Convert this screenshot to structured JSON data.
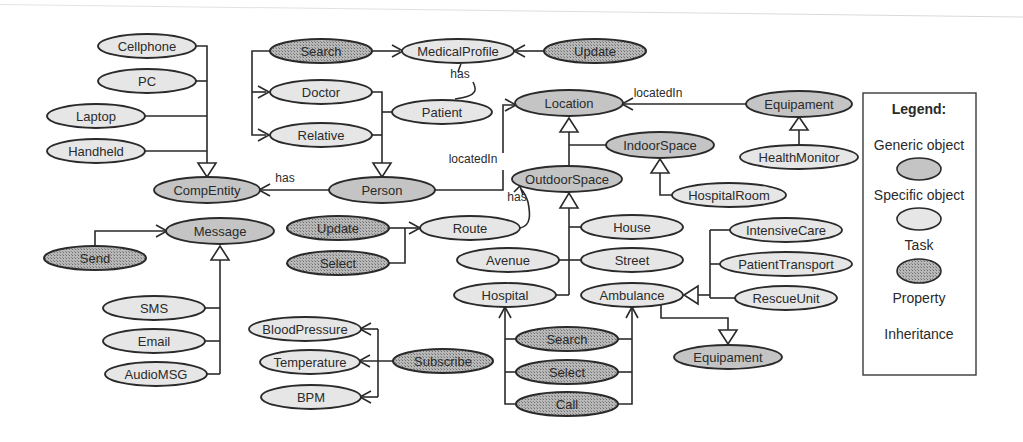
{
  "diagram": {
    "colors": {
      "generic_fill": "#c4c4c4",
      "specific_fill": "#e6e6e6",
      "task_fill": "#9a9a9a",
      "stroke": "#2a2a2a",
      "background": "#ffffff"
    },
    "nodes": [
      {
        "id": "cellphone",
        "label": "Cellphone",
        "type": "specific",
        "cx": 147,
        "cy": 46,
        "rx": 49,
        "ry": 12
      },
      {
        "id": "pc",
        "label": "PC",
        "type": "specific",
        "cx": 147,
        "cy": 81,
        "rx": 49,
        "ry": 12
      },
      {
        "id": "laptop",
        "label": "Laptop",
        "type": "specific",
        "cx": 96,
        "cy": 116,
        "rx": 49,
        "ry": 12
      },
      {
        "id": "handheld",
        "label": "Handheld",
        "type": "specific",
        "cx": 96,
        "cy": 151,
        "rx": 49,
        "ry": 12
      },
      {
        "id": "compentity",
        "label": "CompEntity",
        "type": "generic",
        "cx": 207,
        "cy": 190,
        "rx": 53,
        "ry": 13
      },
      {
        "id": "search1",
        "label": "Search",
        "type": "task",
        "cx": 321,
        "cy": 51,
        "rx": 51,
        "ry": 12
      },
      {
        "id": "medicalprofile",
        "label": "MedicalProfile",
        "type": "specific",
        "cx": 458,
        "cy": 51,
        "rx": 56,
        "ry": 12
      },
      {
        "id": "update1",
        "label": "Update",
        "type": "task",
        "cx": 595,
        "cy": 51,
        "rx": 51,
        "ry": 12
      },
      {
        "id": "doctor",
        "label": "Doctor",
        "type": "specific",
        "cx": 321,
        "cy": 92,
        "rx": 51,
        "ry": 12
      },
      {
        "id": "relative",
        "label": "Relative",
        "type": "specific",
        "cx": 321,
        "cy": 135,
        "rx": 51,
        "ry": 12
      },
      {
        "id": "patient",
        "label": "Patient",
        "type": "specific",
        "cx": 442,
        "cy": 112,
        "rx": 50,
        "ry": 12
      },
      {
        "id": "person",
        "label": "Person",
        "type": "generic",
        "cx": 382,
        "cy": 190,
        "rx": 53,
        "ry": 13
      },
      {
        "id": "location",
        "label": "Location",
        "type": "generic",
        "cx": 569,
        "cy": 103,
        "rx": 54,
        "ry": 13
      },
      {
        "id": "equipament1",
        "label": "Equipament",
        "type": "generic",
        "cx": 799,
        "cy": 104,
        "rx": 53,
        "ry": 13
      },
      {
        "id": "indoorspace",
        "label": "IndoorSpace",
        "type": "generic",
        "cx": 660,
        "cy": 145,
        "rx": 54,
        "ry": 13
      },
      {
        "id": "healthmonitor",
        "label": "HealthMonitor",
        "type": "specific",
        "cx": 799,
        "cy": 157,
        "rx": 59,
        "ry": 12
      },
      {
        "id": "outdoorspace",
        "label": "OutdoorSpace",
        "type": "generic",
        "cx": 567,
        "cy": 179,
        "rx": 55,
        "ry": 13
      },
      {
        "id": "hospitalroom",
        "label": "HospitalRoom",
        "type": "specific",
        "cx": 729,
        "cy": 195,
        "rx": 57,
        "ry": 12
      },
      {
        "id": "message",
        "label": "Message",
        "type": "generic",
        "cx": 220,
        "cy": 231,
        "rx": 54,
        "ry": 13
      },
      {
        "id": "send",
        "label": "Send",
        "type": "task",
        "cx": 95,
        "cy": 258,
        "rx": 51,
        "ry": 12
      },
      {
        "id": "update2",
        "label": "Update",
        "type": "task",
        "cx": 338,
        "cy": 228,
        "rx": 51,
        "ry": 12
      },
      {
        "id": "select1",
        "label": "Select",
        "type": "task",
        "cx": 338,
        "cy": 263,
        "rx": 51,
        "ry": 12
      },
      {
        "id": "route",
        "label": "Route",
        "type": "specific",
        "cx": 470,
        "cy": 228,
        "rx": 50,
        "ry": 12
      },
      {
        "id": "house",
        "label": "House",
        "type": "specific",
        "cx": 632,
        "cy": 227,
        "rx": 51,
        "ry": 12
      },
      {
        "id": "avenue",
        "label": "Avenue",
        "type": "specific",
        "cx": 508,
        "cy": 260,
        "rx": 51,
        "ry": 12
      },
      {
        "id": "street",
        "label": "Street",
        "type": "specific",
        "cx": 632,
        "cy": 260,
        "rx": 51,
        "ry": 12
      },
      {
        "id": "intensivecare",
        "label": "IntensiveCare",
        "type": "specific",
        "cx": 786,
        "cy": 230,
        "rx": 56,
        "ry": 12
      },
      {
        "id": "patienttransport",
        "label": "PatientTransport",
        "type": "specific",
        "cx": 786,
        "cy": 264,
        "rx": 66,
        "ry": 12
      },
      {
        "id": "rescueunit",
        "label": "RescueUnit",
        "type": "specific",
        "cx": 786,
        "cy": 298,
        "rx": 51,
        "ry": 12
      },
      {
        "id": "hospital",
        "label": "Hospital",
        "type": "specific",
        "cx": 505,
        "cy": 295,
        "rx": 51,
        "ry": 12
      },
      {
        "id": "ambulance",
        "label": "Ambulance",
        "type": "specific",
        "cx": 632,
        "cy": 295,
        "rx": 51,
        "ry": 12
      },
      {
        "id": "sms",
        "label": "SMS",
        "type": "specific",
        "cx": 154,
        "cy": 308,
        "rx": 51,
        "ry": 12
      },
      {
        "id": "email",
        "label": "Email",
        "type": "specific",
        "cx": 154,
        "cy": 341,
        "rx": 51,
        "ry": 12
      },
      {
        "id": "audiomsg",
        "label": "AudioMSG",
        "type": "specific",
        "cx": 156,
        "cy": 374,
        "rx": 51,
        "ry": 12
      },
      {
        "id": "bloodpressure",
        "label": "BloodPressure",
        "type": "specific",
        "cx": 305,
        "cy": 329,
        "rx": 56,
        "ry": 12
      },
      {
        "id": "temperature",
        "label": "Temperature",
        "type": "specific",
        "cx": 310,
        "cy": 362,
        "rx": 50,
        "ry": 12
      },
      {
        "id": "subscribe",
        "label": "Subscribe",
        "type": "task",
        "cx": 443,
        "cy": 361,
        "rx": 50,
        "ry": 12
      },
      {
        "id": "bpm",
        "label": "BPM",
        "type": "specific",
        "cx": 311,
        "cy": 397,
        "rx": 50,
        "ry": 12
      },
      {
        "id": "search2",
        "label": "Search",
        "type": "task",
        "cx": 567,
        "cy": 339,
        "rx": 51,
        "ry": 12
      },
      {
        "id": "select2",
        "label": "Select",
        "type": "task",
        "cx": 567,
        "cy": 372,
        "rx": 51,
        "ry": 12
      },
      {
        "id": "call",
        "label": "Call",
        "type": "task",
        "cx": 567,
        "cy": 404,
        "rx": 51,
        "ry": 12
      },
      {
        "id": "equipament2",
        "label": "Equipament",
        "type": "generic",
        "cx": 728,
        "cy": 357,
        "rx": 54,
        "ry": 12
      }
    ],
    "edge_labels": [
      {
        "id": "label-has-medicalprofile",
        "text": "has",
        "x": 460,
        "y": 78
      },
      {
        "id": "label-locatedin-equipament",
        "text": "locatedIn",
        "x": 658,
        "y": 97
      },
      {
        "id": "label-has-compentity",
        "text": "has",
        "x": 285,
        "y": 182
      },
      {
        "id": "label-locatedin-person",
        "text": "locatedIn",
        "x": 473,
        "y": 163
      },
      {
        "id": "label-has-route",
        "text": "has",
        "x": 517,
        "y": 201
      }
    ],
    "legend": {
      "title": "Legend:",
      "items": [
        {
          "label": "Generic object",
          "type": "generic"
        },
        {
          "label": "Specific object",
          "type": "specific"
        },
        {
          "label": "Task",
          "type": "task"
        },
        {
          "label": "Property",
          "type": "none"
        },
        {
          "label": "Inheritance",
          "type": "none"
        }
      ]
    }
  }
}
